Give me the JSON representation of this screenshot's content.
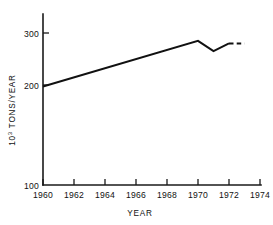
{
  "chart_data": {
    "type": "line",
    "title": "",
    "xlabel": "YEAR",
    "ylabel": "10³ TONS/YEAR",
    "ylabel_base": "10",
    "ylabel_exponent": "3",
    "ylabel_rest": " TONS/YEAR",
    "xlim": [
      1960,
      1974
    ],
    "ylim": [
      100,
      300
    ],
    "grid": false,
    "legend": "none",
    "line_color": "#111111",
    "axis_color": "#1a1a1a",
    "background_color": "#ffffff",
    "y_axis_broken_below": 200,
    "yticks": [
      100,
      200,
      300
    ],
    "ytick_labels": [
      "100",
      "200",
      "300"
    ],
    "xticks": [
      1960,
      1962,
      1964,
      1966,
      1968,
      1970,
      1972,
      1974
    ],
    "xtick_labels": [
      "1960",
      "1962",
      "1964",
      "1966",
      "1968",
      "1970",
      "1972",
      "1974"
    ],
    "series": [
      {
        "name": "production",
        "style": "solid",
        "x": [
          1960,
          1970,
          1971,
          1972
        ],
        "values": [
          197,
          285,
          265,
          280
        ]
      },
      {
        "name": "production-projected",
        "style": "dashed",
        "x": [
          1972,
          1973
        ],
        "values": [
          280,
          280
        ]
      }
    ]
  }
}
